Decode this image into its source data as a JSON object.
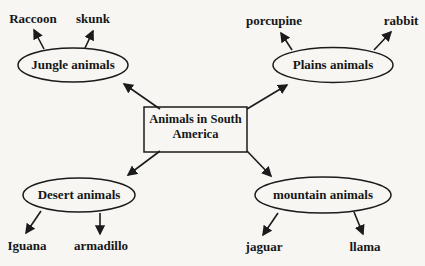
{
  "page": {
    "background_color": "#f7f6f3",
    "ink_color": "#1b1b1b"
  },
  "concept_map": {
    "type": "spider-map",
    "center_node": {
      "label": "Animals in South America",
      "line1": "Animals in South",
      "line2": "America"
    },
    "branches": [
      {
        "label": "Jungle animals",
        "position": "top-left",
        "leaves": [
          "Raccoon",
          "skunk"
        ]
      },
      {
        "label": "Plains animals",
        "position": "top-right",
        "leaves": [
          "porcupine",
          "rabbit"
        ]
      },
      {
        "label": "Desert animals",
        "position": "bottom-left",
        "leaves": [
          "Iguana",
          "armadillo"
        ]
      },
      {
        "label": "mountain animals",
        "position": "bottom-right",
        "leaves": [
          "jaguar",
          "llama"
        ]
      }
    ]
  }
}
